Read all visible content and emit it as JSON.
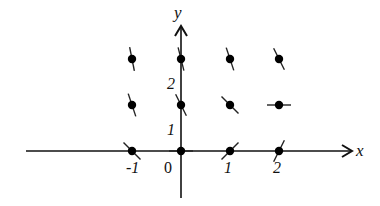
{
  "equation": "dy/dx = x - 2y",
  "axes": {
    "x_label": "x",
    "y_label": "y",
    "x_ticks": [
      {
        "value": -1,
        "label": "-1"
      },
      {
        "value": 0,
        "label": "0"
      },
      {
        "value": 1,
        "label": "1"
      },
      {
        "value": 2,
        "label": "2"
      }
    ],
    "y_ticks": [
      {
        "value": 1,
        "label": "1"
      },
      {
        "value": 2,
        "label": "2"
      }
    ]
  },
  "points": [
    {
      "x": -1,
      "y": 0,
      "slope": -1
    },
    {
      "x": 0,
      "y": 0,
      "slope": 0
    },
    {
      "x": 1,
      "y": 0,
      "slope": 1
    },
    {
      "x": 2,
      "y": 0,
      "slope": 2
    },
    {
      "x": -1,
      "y": 1,
      "slope": -3
    },
    {
      "x": 0,
      "y": 1,
      "slope": -2
    },
    {
      "x": 1,
      "y": 1,
      "slope": -1
    },
    {
      "x": 2,
      "y": 1,
      "slope": 0
    },
    {
      "x": -1,
      "y": 2,
      "slope": -5
    },
    {
      "x": 0,
      "y": 2,
      "slope": -4
    },
    {
      "x": 1,
      "y": 2,
      "slope": -3
    },
    {
      "x": 2,
      "y": 2,
      "slope": -2
    }
  ]
}
